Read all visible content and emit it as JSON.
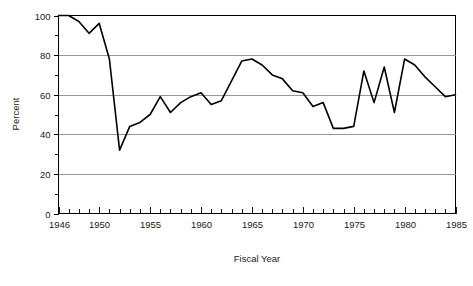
{
  "figure": {
    "name": "percent-by-fiscal-year-line-chart",
    "background_color": "#ffffff",
    "line_color": "#000000",
    "grid_color": "#8c8c8c",
    "axis_color": "#000000"
  },
  "axes": {
    "y_title": "Percent",
    "x_title": "Fiscal Year",
    "y_tick_labels": [
      "0",
      "20",
      "40",
      "60",
      "80",
      "100"
    ],
    "x_tick_labels": [
      "1946",
      "1950",
      "1955",
      "1960",
      "1965",
      "1970",
      "1975",
      "1980",
      "1985"
    ]
  },
  "caption": {
    "partial_bottom_text": ""
  },
  "chart_data": {
    "type": "line",
    "title": "",
    "subtitle": "",
    "xlabel": "Fiscal Year",
    "ylabel": "Percent",
    "xlim": [
      1946,
      1985
    ],
    "ylim": [
      0,
      100
    ],
    "y_major_ticks": [
      0,
      20,
      40,
      60,
      80,
      100
    ],
    "y_minor_ticks": [
      10,
      30,
      50,
      70,
      90
    ],
    "x_major_ticks": [
      1946,
      1950,
      1955,
      1960,
      1965,
      1970,
      1975,
      1980,
      1985
    ],
    "x_tick_interval_years": 1,
    "grid": "horizontal-major-only",
    "legend": "none",
    "series": [
      {
        "name": "Percent",
        "x": [
          1946,
          1947,
          1948,
          1949,
          1950,
          1951,
          1952,
          1953,
          1954,
          1955,
          1956,
          1957,
          1958,
          1959,
          1960,
          1961,
          1962,
          1963,
          1964,
          1965,
          1966,
          1967,
          1968,
          1969,
          1970,
          1971,
          1972,
          1973,
          1974,
          1975,
          1976,
          1977,
          1978,
          1979,
          1980,
          1981,
          1982,
          1983,
          1984,
          1985
        ],
        "values": [
          100,
          100,
          97,
          91,
          96,
          78,
          32,
          44,
          46,
          50,
          59,
          51,
          56,
          59,
          61,
          55,
          57,
          67,
          77,
          78,
          75,
          70,
          68,
          62,
          61,
          54,
          56,
          43,
          43,
          44,
          72,
          56,
          74,
          51,
          78,
          75,
          69,
          64,
          59,
          60
        ]
      }
    ]
  }
}
